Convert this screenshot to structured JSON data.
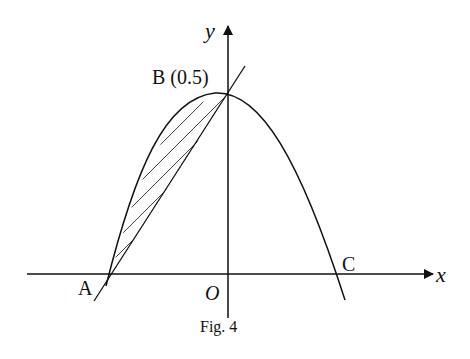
{
  "figure": {
    "caption": "Fig. 4",
    "axes": {
      "x_label": "x",
      "y_label": "y",
      "origin_label": "O"
    },
    "points": {
      "A": {
        "label": "A"
      },
      "B": {
        "label": "B (0.5)"
      },
      "C": {
        "label": "C"
      }
    },
    "elements": [
      "parabola through A, B, C (opening downward)",
      "straight line through A and B",
      "shaded region between line AB and parabola"
    ],
    "colors": {
      "stroke": "#111111",
      "background": "#ffffff"
    }
  }
}
